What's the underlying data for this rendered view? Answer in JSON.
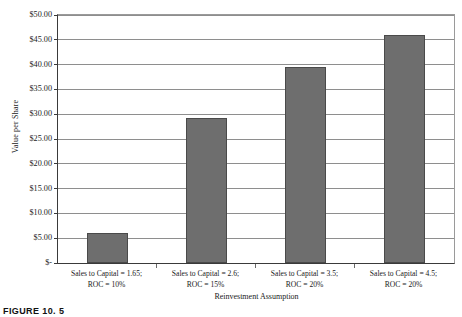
{
  "figure": {
    "caption": "FIGURE 10. 5"
  },
  "chart_data": {
    "type": "bar",
    "title": "",
    "xlabel": "Reinvestment Assumption",
    "ylabel": "Value per Share",
    "categories": [
      "Sales to Capital = 1.65;\nROC = 10%",
      "Sales to Capital = 2.6;\nROC = 15%",
      "Sales to Capital = 3.5;\nROC = 20%",
      "Sales to Capital = 4.5;\nROC = 20%"
    ],
    "category_lines": [
      [
        "Sales to Capital = 1.65;",
        "ROC = 10%"
      ],
      [
        "Sales to Capital = 2.6;",
        "ROC = 15%"
      ],
      [
        "Sales to Capital = 3.5;",
        "ROC = 20%"
      ],
      [
        "Sales to Capital = 4.5;",
        "ROC = 20%"
      ]
    ],
    "values": [
      6.0,
      29.2,
      39.5,
      46.0
    ],
    "ylim": [
      0,
      50
    ],
    "ytick_values": [
      0,
      5,
      10,
      15,
      20,
      25,
      30,
      35,
      40,
      45,
      50
    ],
    "ytick_labels": [
      "$-",
      "$5.00",
      "$10.00",
      "$15.00",
      "$20.00",
      "$25.00",
      "$30.00",
      "$35.00",
      "$40.00",
      "$45.00",
      "$50.00"
    ],
    "grid": true,
    "legend": false,
    "bar_color": "#6e6e6e",
    "gridline_color": "#8e8e8e",
    "axis_color": "#3a3a3a"
  }
}
